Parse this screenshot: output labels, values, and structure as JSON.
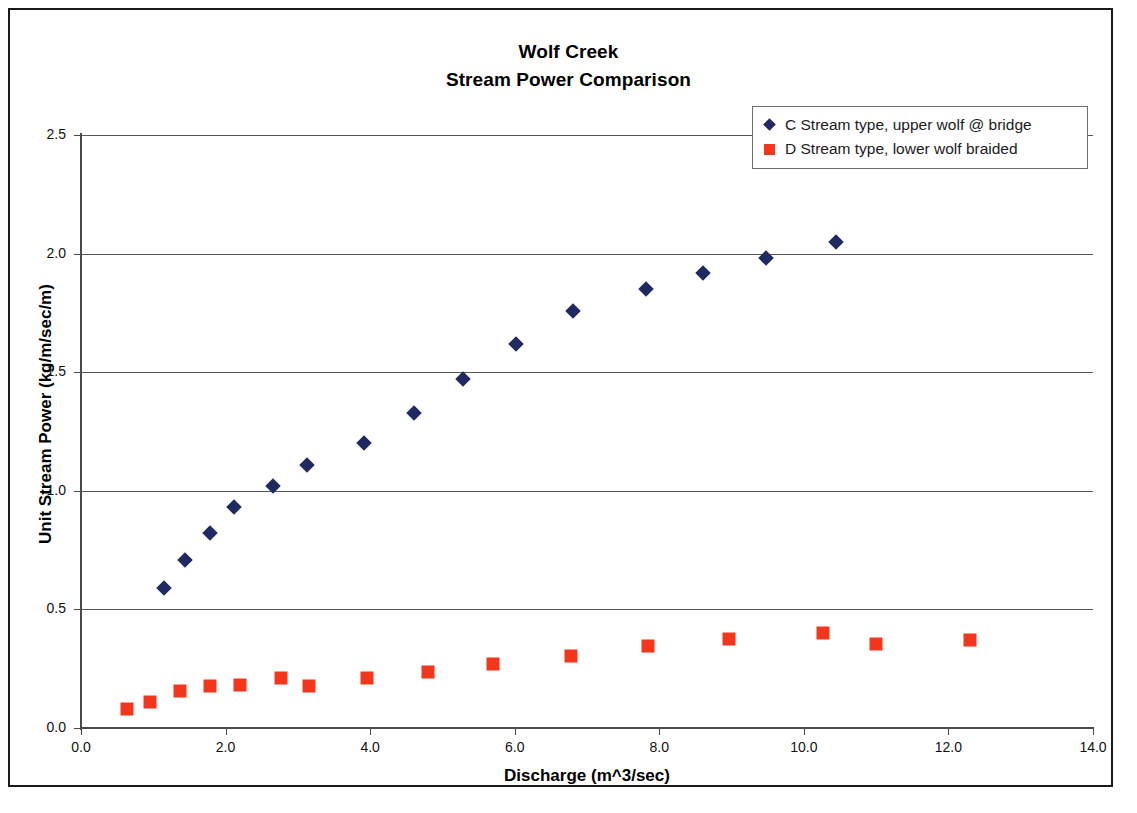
{
  "chart_data": {
    "type": "scatter",
    "title": "Wolf Creek",
    "subtitle": "Stream Power Comparison",
    "title_lines": [
      "Wolf Creek",
      "Stream Power Comparison"
    ],
    "xlabel": "Discharge (m^3/sec)",
    "ylabel": "Unit Stream Power (kg/m/sec/m)",
    "xlim": [
      0.0,
      14.0
    ],
    "ylim": [
      0.0,
      2.5
    ],
    "xticks": [
      "0.0",
      "2.0",
      "4.0",
      "6.0",
      "8.0",
      "10.0",
      "12.0",
      "14.0"
    ],
    "yticks": [
      "0.0",
      "0.5",
      "1.0",
      "1.5",
      "2.0",
      "2.5"
    ],
    "xtick_values": [
      0.0,
      2.0,
      4.0,
      6.0,
      8.0,
      10.0,
      12.0,
      14.0
    ],
    "ytick_values": [
      0.0,
      0.5,
      1.0,
      1.5,
      2.0,
      2.5
    ],
    "grid": "horizontal",
    "legend_position": "top-right",
    "series": [
      {
        "name": "C Stream type, upper wolf @ bridge",
        "marker": "diamond",
        "color": "#1f2a63",
        "points": [
          [
            1.15,
            0.59
          ],
          [
            1.44,
            0.71
          ],
          [
            1.78,
            0.82
          ],
          [
            2.12,
            0.93
          ],
          [
            2.65,
            1.02
          ],
          [
            3.13,
            1.11
          ],
          [
            3.92,
            1.2
          ],
          [
            4.6,
            1.33
          ],
          [
            5.28,
            1.47
          ],
          [
            6.02,
            1.62
          ],
          [
            6.8,
            1.76
          ],
          [
            7.82,
            1.85
          ],
          [
            8.6,
            1.92
          ],
          [
            9.48,
            1.98
          ],
          [
            10.45,
            2.05
          ]
        ]
      },
      {
        "name": "D Stream type, lower wolf braided",
        "marker": "square",
        "color": "#f4361d",
        "points": [
          [
            0.64,
            0.08
          ],
          [
            0.96,
            0.11
          ],
          [
            1.37,
            0.155
          ],
          [
            1.78,
            0.175
          ],
          [
            2.2,
            0.18
          ],
          [
            2.77,
            0.21
          ],
          [
            3.15,
            0.175
          ],
          [
            3.95,
            0.21
          ],
          [
            4.8,
            0.235
          ],
          [
            5.7,
            0.27
          ],
          [
            6.78,
            0.305
          ],
          [
            7.85,
            0.345
          ],
          [
            8.97,
            0.375
          ],
          [
            10.27,
            0.4
          ],
          [
            11.0,
            0.355
          ],
          [
            12.3,
            0.37
          ]
        ]
      }
    ]
  },
  "legend": {
    "items": [
      {
        "label": "C Stream type, upper wolf @ bridge",
        "marker": "diamond"
      },
      {
        "label": "D Stream type, lower wolf braided",
        "marker": "square"
      }
    ]
  },
  "colors": {
    "series_c": "#1f2a63",
    "series_d": "#f4361d",
    "gridline": "#585858",
    "axis": "#4a4a4a",
    "frame": "#1a1a1a"
  }
}
